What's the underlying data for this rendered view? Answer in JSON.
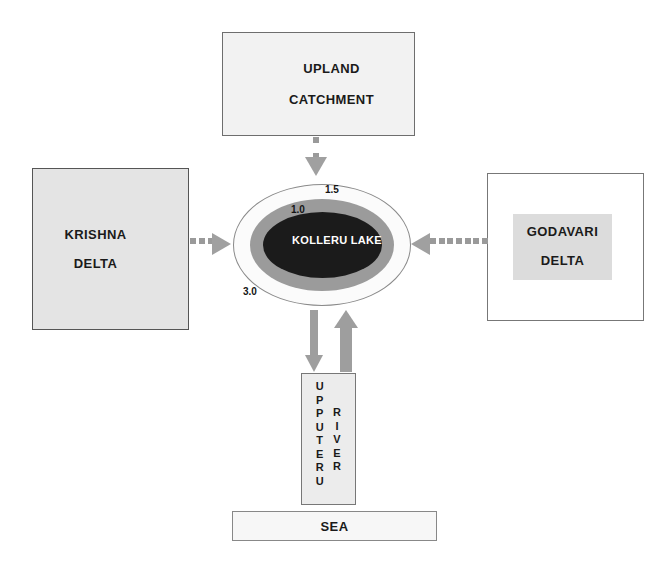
{
  "diagram": {
    "nodes": {
      "upland_catchment": {
        "line1": "UPLAND",
        "line2": "CATCHMENT"
      },
      "krishna_delta": {
        "line1": "KRISHNA",
        "line2": "DELTA"
      },
      "godavari_delta": {
        "line1": "GODAVARI",
        "line2": "DELTA"
      },
      "lake": {
        "line1": "KOLLERU",
        "line2": "LAKE",
        "depth_contours": [
          {
            "id": "contour-1-5",
            "label": "1.5"
          },
          {
            "id": "contour-1-0",
            "label": "1.0"
          },
          {
            "id": "contour-3-0",
            "label": "3.0"
          }
        ]
      },
      "upputeru_river": {
        "column1": "UPPUTERU",
        "column2": "RIVER"
      },
      "sea": {
        "label": "SEA"
      }
    },
    "connectors": [
      {
        "id": "upland-to-lake",
        "from": "UPLAND CATCHMENT",
        "to": "KOLLERU LAKE",
        "style": "dotted",
        "direction": "down"
      },
      {
        "id": "krishna-to-lake",
        "from": "KRISHNA DELTA",
        "to": "KOLLERU LAKE",
        "style": "dotted",
        "direction": "right"
      },
      {
        "id": "godavari-to-lake",
        "from": "GODAVARI DELTA",
        "to": "KOLLERU LAKE",
        "style": "dotted",
        "direction": "left"
      },
      {
        "id": "lake-to-river",
        "from": "KOLLERU LAKE",
        "to": "UPPUTERU RIVER",
        "style": "solid",
        "direction": "down"
      },
      {
        "id": "river-to-lake",
        "from": "UPPUTERU RIVER",
        "to": "KOLLERU LAKE",
        "style": "solid",
        "direction": "up"
      }
    ],
    "colors": {
      "lake_outer": "#fbfbfb",
      "lake_middle": "#9b9b9b",
      "lake_inner": "#1b1b1b",
      "arrow_gray": "#9e9e9e",
      "box_gray": "#e4e4e4"
    }
  }
}
